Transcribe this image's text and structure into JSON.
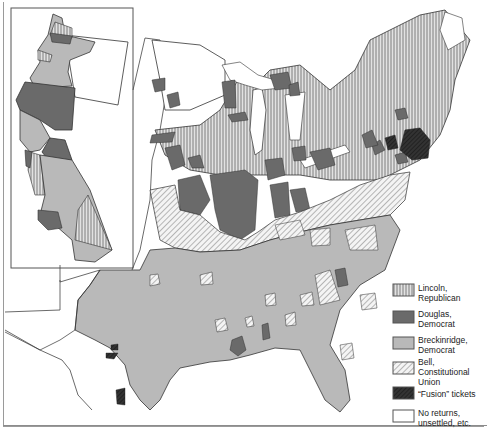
{
  "map": {
    "subject": "Presidential election results by county",
    "inset": {
      "region": "Pacific Coast (Oregon and California)"
    },
    "main": {
      "region": "Eastern and Central United States"
    }
  },
  "legend": {
    "items": [
      {
        "id": "lincoln",
        "label": "Lincoln,\nRepublican",
        "pattern": "vertical-lines",
        "color": "#b8b8b8"
      },
      {
        "id": "douglas",
        "label": "Douglas,\nDemocrat",
        "pattern": "solid",
        "color": "#6a6a6a"
      },
      {
        "id": "breckinridge",
        "label": "Breckinridge,\nDemocrat",
        "pattern": "solid",
        "color": "#b9b9b9"
      },
      {
        "id": "bell",
        "label": "Bell,\nConstitutional\nUnion",
        "pattern": "diagonal-lines",
        "color": "#e6e6e6"
      },
      {
        "id": "fusion",
        "label": "“Fusion” tickets",
        "pattern": "dark-crosshatch",
        "color": "#2e2e2e"
      },
      {
        "id": "none",
        "label": "No returns,\nunsettled, etc.",
        "pattern": "solid",
        "color": "#ffffff"
      }
    ]
  },
  "colors": {
    "republican": "#b8b8b8",
    "douglas": "#6a6a6a",
    "breckinridge": "#b9b9b9",
    "bell": "#e6e6e6",
    "fusion": "#2e2e2e",
    "none": "#ffffff",
    "border": "#333333"
  }
}
